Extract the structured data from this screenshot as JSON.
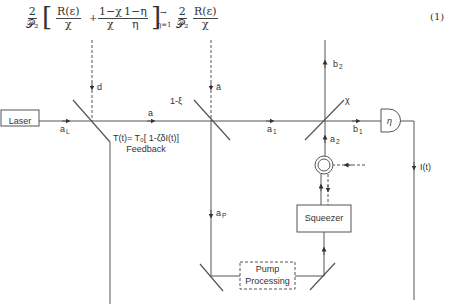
{
  "equation": {
    "prefix_num": "2",
    "prefix_den": "𝒫₂",
    "term1_num": "R(ε)",
    "term1_den": "χ",
    "plus": "+",
    "term2a_num": "1−χ",
    "term2a_den": "χ",
    "term2b_num": "1−η",
    "term2b_den": "η",
    "arrow": "→",
    "limit": "η=1",
    "result_num": "2",
    "result_den": "𝒫₂",
    "result2_num": "R(ε)",
    "result2_den": "χ",
    "number": "(1)"
  },
  "diagram": {
    "laser_label": "Laser",
    "squeezer_label": "Squeezer",
    "pump_line1": "Pump",
    "pump_line2": "Processing",
    "feedback_formula": "T(t)= T₀[ 1-ζδI(t)]",
    "feedback_label": "Feedback",
    "detector_label": "η",
    "labels": {
      "d": "d",
      "a_bar": "ā",
      "one_minus_xi": "1-ξ",
      "a": "a",
      "a_L": "a",
      "a_L_sub": "L",
      "a_1": "a",
      "a_1_sub": "1",
      "b_1": "b",
      "b_1_sub": "1",
      "b_2": "b",
      "b_2_sub": "2",
      "a_2": "a",
      "a_2_sub": "2",
      "a_P": "a",
      "a_P_sub": "P",
      "chi": "χ",
      "I_t": "I(t)"
    },
    "colors": {
      "line": "#555555",
      "text": "#333333"
    }
  }
}
